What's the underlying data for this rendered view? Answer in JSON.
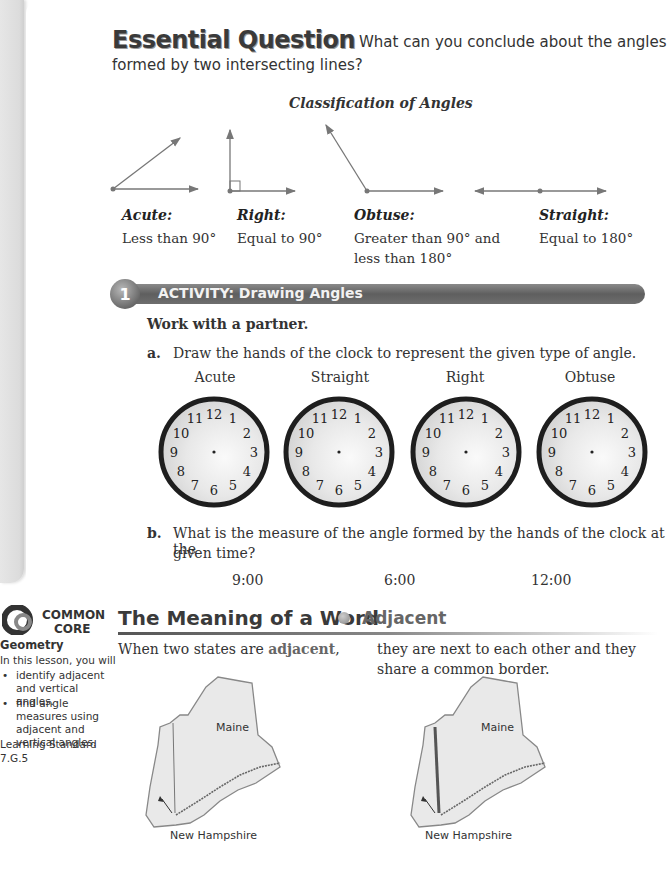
{
  "essential_question": {
    "title": "Essential Question",
    "text_line1": "What can you conclude about the angles",
    "text_line2": "formed by two intersecting lines?"
  },
  "classification": {
    "title": "Classification of Angles",
    "angles": [
      {
        "name": "Acute:",
        "desc_line1": "Less than 90°",
        "desc_line2": ""
      },
      {
        "name": "Right:",
        "desc_line1": "Equal to 90°",
        "desc_line2": ""
      },
      {
        "name": "Obtuse:",
        "desc_line1": "Greater than 90° and",
        "desc_line2": "less than 180°"
      },
      {
        "name": "Straight:",
        "desc_line1": "Equal to 180°",
        "desc_line2": ""
      }
    ]
  },
  "activity": {
    "number": "1",
    "label": "ACTIVITY: Drawing Angles",
    "instruction": "Work with a partner.",
    "part_a": {
      "letter": "a.",
      "text": "Draw the hands of the clock to represent the given type of angle.",
      "clocks": [
        {
          "label": "Acute"
        },
        {
          "label": "Straight"
        },
        {
          "label": "Right"
        },
        {
          "label": "Obtuse"
        }
      ],
      "clock_numbers": [
        "12",
        "1",
        "2",
        "3",
        "4",
        "5",
        "6",
        "7",
        "8",
        "9",
        "10",
        "11"
      ]
    },
    "part_b": {
      "letter": "b.",
      "text_line1": "What is the measure of the angle formed by the hands of the clock at the",
      "text_line2": "given time?",
      "times": [
        "9:00",
        "6:00",
        "12:00"
      ]
    }
  },
  "meaning_of_word": {
    "title": "The Meaning of a Word",
    "word": "Adjacent",
    "left_text_prefix": "When two states are ",
    "left_text_highlight": "adjacent",
    "left_text_suffix": ",",
    "right_text_line1": "they are next to each other and they",
    "right_text_line2": "share a common border.",
    "maps": [
      {
        "state_label": "Maine",
        "neighbor_label": "New Hampshire"
      },
      {
        "state_label": "Maine",
        "neighbor_label": "New Hampshire"
      }
    ]
  },
  "sidebar": {
    "logo_line1": "COMMON",
    "logo_line2": "CORE",
    "subject": "Geometry",
    "intro": "In this lesson, you will",
    "bullets": [
      "identify adjacent and vertical angles.",
      "find angle measures using adjacent and vertical angles."
    ],
    "standard_label": "Learning Standard",
    "standard_code": "7.G.5"
  },
  "colors": {
    "line_gray": "#777777",
    "bar_gray": "#666666",
    "text": "#333333"
  }
}
